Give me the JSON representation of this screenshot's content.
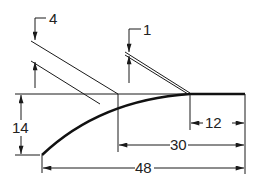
{
  "drawing": {
    "type": "technical-dimension-drawing",
    "stroke_color": "#1a1a1a",
    "background": "#ffffff"
  },
  "dimensions": {
    "thickness_left": "4",
    "thickness_right": "1",
    "height": "14",
    "flat_length": "12",
    "middle_length": "30",
    "total_length": "48"
  }
}
